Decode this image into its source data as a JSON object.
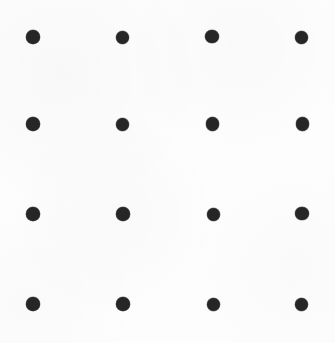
{
  "figure": {
    "description": "A 4 by 4 square grid of solid dark circular dots on a plain white background.",
    "canvas": {
      "width": 335,
      "height": 343,
      "background_color": "#fdfdfd"
    },
    "dot_style": {
      "color": "#262626",
      "shape": "circle",
      "diameter": 13.5
    },
    "grid": {
      "rows": 4,
      "columns": 4,
      "total_dots": 16,
      "column_centers_x": [
        33,
        122.5,
        212.5,
        301.5
      ],
      "row_centers_y": [
        37,
        124,
        214,
        304
      ],
      "column_spacing": 89.5,
      "row_spacing": 89
    },
    "dots": [
      {
        "id": "dot-r1-c1",
        "row": 1,
        "col": 1,
        "cx": 33.0,
        "cy": 37.0,
        "d": 13.5
      },
      {
        "id": "dot-r1-c2",
        "row": 1,
        "col": 2,
        "cx": 122.0,
        "cy": 37.0,
        "d": 13.0
      },
      {
        "id": "dot-r1-c3",
        "row": 1,
        "col": 3,
        "cx": 212.0,
        "cy": 36.5,
        "d": 13.5
      },
      {
        "id": "dot-r1-c4",
        "row": 1,
        "col": 4,
        "cx": 301.0,
        "cy": 37.0,
        "d": 13.0
      },
      {
        "id": "dot-r2-c1",
        "row": 2,
        "col": 1,
        "cx": 33.0,
        "cy": 124.0,
        "d": 13.5
      },
      {
        "id": "dot-r2-c2",
        "row": 2,
        "col": 2,
        "cx": 122.5,
        "cy": 124.0,
        "d": 13.0
      },
      {
        "id": "dot-r2-c3",
        "row": 2,
        "col": 3,
        "cx": 212.5,
        "cy": 124.0,
        "d": 13.5
      },
      {
        "id": "dot-r2-c4",
        "row": 2,
        "col": 4,
        "cx": 302.5,
        "cy": 124.0,
        "d": 13.5
      },
      {
        "id": "dot-r3-c1",
        "row": 3,
        "col": 1,
        "cx": 33.0,
        "cy": 214.0,
        "d": 13.5
      },
      {
        "id": "dot-r3-c2",
        "row": 3,
        "col": 2,
        "cx": 123.0,
        "cy": 214.0,
        "d": 13.5
      },
      {
        "id": "dot-r3-c3",
        "row": 3,
        "col": 3,
        "cx": 213.0,
        "cy": 214.0,
        "d": 13.0
      },
      {
        "id": "dot-r3-c4",
        "row": 3,
        "col": 4,
        "cx": 302.0,
        "cy": 213.5,
        "d": 13.5
      },
      {
        "id": "dot-r4-c1",
        "row": 4,
        "col": 1,
        "cx": 33.0,
        "cy": 304.0,
        "d": 13.5
      },
      {
        "id": "dot-r4-c2",
        "row": 4,
        "col": 2,
        "cx": 123.0,
        "cy": 304.0,
        "d": 13.5
      },
      {
        "id": "dot-r4-c3",
        "row": 4,
        "col": 3,
        "cx": 213.0,
        "cy": 304.0,
        "d": 13.0
      },
      {
        "id": "dot-r4-c4",
        "row": 4,
        "col": 4,
        "cx": 301.5,
        "cy": 304.0,
        "d": 13.0
      }
    ]
  }
}
